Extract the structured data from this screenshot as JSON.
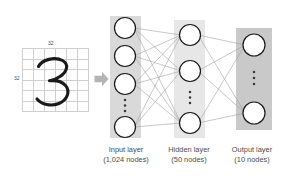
{
  "figure": {
    "type": "neural-network-diagram",
    "background_color": "#ffffff"
  },
  "input_image": {
    "digit": "3",
    "grid_rows": 6,
    "grid_cols": 6,
    "grid_line_color": "#cfcfcf",
    "width_label": "32",
    "height_label": "32",
    "stroke_color": "#1a1a1a"
  },
  "arrow": {
    "icon": "arrow-right-icon",
    "color": "#b3b3b3"
  },
  "layers": [
    {
      "id": "input",
      "title": "Input layer",
      "subtitle": "(1,024 nodes)",
      "node_count_label": "1,024",
      "drawn_nodes": 4,
      "ellipsis": true,
      "panel_color": "#d9d9d9"
    },
    {
      "id": "hidden",
      "title": "Hidden layer",
      "subtitle": "(50 nodes)",
      "node_count_label": "50",
      "drawn_nodes": 3,
      "ellipsis": true,
      "panel_color": "#e6e6e6"
    },
    {
      "id": "output",
      "title": "Output layer",
      "subtitle": "(10 nodes)",
      "node_count_label": "10",
      "drawn_nodes": 2,
      "ellipsis": true,
      "panel_color": "#c9c9c9"
    }
  ],
  "connections": {
    "style": "fully-connected",
    "line_color": "#9a9a9a"
  },
  "node_style": {
    "fill": "#ffffff",
    "stroke": "#1a1a1a"
  }
}
